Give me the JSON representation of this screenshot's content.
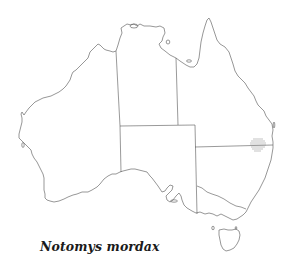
{
  "map": {
    "title": "Notomys mordax",
    "region": "Australia",
    "distribution_marker": {
      "description": "hatched area near QLD/NSW border, east coast",
      "center": [
        258,
        145
      ],
      "color": "#9a9a9a"
    },
    "colors": {
      "outline": "#6a6a6a",
      "borders": "#555555",
      "background": "#ffffff",
      "label": "#1a1a1a"
    }
  }
}
